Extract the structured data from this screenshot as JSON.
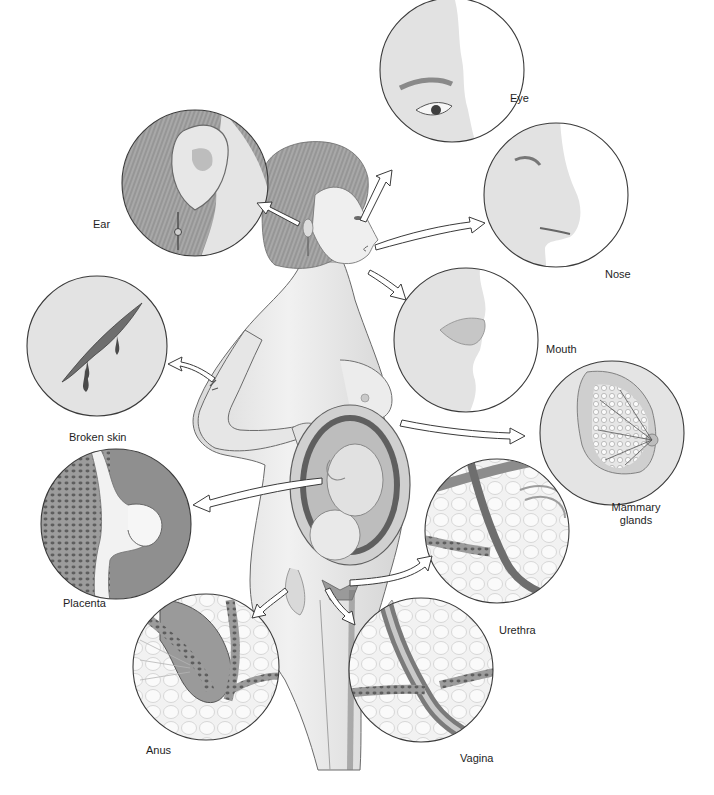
{
  "figure": {
    "colors": {
      "background": "#ffffff",
      "outline": "#3a3a3a",
      "circle_fill": "#e4e4e4",
      "skin": "#ececec",
      "skin_shade": "#cfcfcf",
      "hair": "#9a9a9a",
      "tissue_dark": "#7d7d7d",
      "arrow_fill": "#ffffff",
      "label_text": "#1e1e1e"
    },
    "callouts": [
      {
        "id": "eye",
        "label": "Eye",
        "cx": 452,
        "cy": 70,
        "r": 72
      },
      {
        "id": "nose",
        "label": "Nose",
        "cx": 556,
        "cy": 195,
        "r": 72
      },
      {
        "id": "ear",
        "label": "Ear",
        "cx": 195,
        "cy": 183,
        "r": 73
      },
      {
        "id": "mouth",
        "label": "Mouth",
        "cx": 466,
        "cy": 340,
        "r": 72
      },
      {
        "id": "broken-skin",
        "label": "Broken skin",
        "cx": 97,
        "cy": 346,
        "r": 70
      },
      {
        "id": "mammary-glands",
        "label": "Mammary glands",
        "cx": 612,
        "cy": 433,
        "r": 72
      },
      {
        "id": "placenta",
        "label": "Placenta",
        "cx": 116,
        "cy": 524,
        "r": 75
      },
      {
        "id": "urethra",
        "label": "Urethra",
        "cx": 497,
        "cy": 531,
        "r": 72
      },
      {
        "id": "anus",
        "label": "Anus",
        "cx": 206,
        "cy": 667,
        "r": 73
      },
      {
        "id": "vagina",
        "label": "Vagina",
        "cx": 421,
        "cy": 670,
        "r": 72
      }
    ],
    "labels": {
      "eye": "Eye",
      "nose": "Nose",
      "ear": "Ear",
      "mouth": "Mouth",
      "broken_skin": "Broken skin",
      "mammary_line1": "Mammary",
      "mammary_line2": "glands",
      "placenta": "Placenta",
      "urethra": "Urethra",
      "anus": "Anus",
      "vagina": "Vagina"
    },
    "icons": {
      "callout-arrow": "hollow curved arrow",
      "central-figure": "pregnant woman profile with cutaway uterus"
    }
  }
}
